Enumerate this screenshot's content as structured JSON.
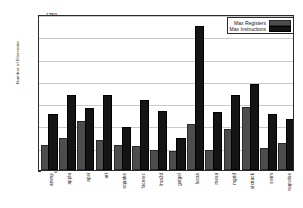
{
  "chart_data": {
    "type": "bar",
    "title": "",
    "xlabel": "",
    "ylabel": "Number of Elements",
    "ylim": [
      0,
      1750
    ],
    "yticks": [
      0,
      250,
      500,
      750,
      1000,
      1250,
      1500,
      1750
    ],
    "grid": true,
    "legend_position": "top-right",
    "categories": [
      "ammp",
      "applu",
      "apsi",
      "art",
      "equake",
      "facerec",
      "fma3d",
      "galgel",
      "lucas",
      "mesa",
      "mgrid",
      "sixtrack",
      "swim",
      "wupwise"
    ],
    "series": [
      {
        "name": "Max Registers",
        "color": "#4d4d4d",
        "values": [
          262,
          342,
          531,
          313,
          260,
          251,
          200,
          196,
          497,
          201,
          441,
          687,
          229,
          283
        ]
      },
      {
        "name": "Max Instructions",
        "color": "#141414",
        "values": [
          609,
          818,
          672,
          815,
          461,
          766,
          641,
          337,
          1588,
          630,
          821,
          945,
          603,
          553
        ]
      }
    ]
  },
  "legend": {
    "items": [
      {
        "label": "Max Registers",
        "swatch": "reg"
      },
      {
        "label": "Max Instructions",
        "swatch": "ins"
      }
    ]
  }
}
